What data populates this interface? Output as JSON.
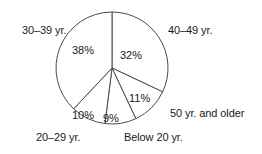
{
  "chart_data": {
    "type": "pie",
    "title": "",
    "subtitle": "",
    "xlabel": "",
    "ylabel": "",
    "legend_position": "none",
    "grid": false,
    "start_angle_deg": 0,
    "direction": "clockwise",
    "categories": [
      "40–49 yr.",
      "50 yr. and older",
      "Below 20 yr.",
      "20–29 yr.",
      "30–39 yr."
    ],
    "values": [
      32,
      11,
      9,
      10,
      38
    ],
    "value_labels": [
      "32%",
      "11%",
      "9%",
      "10%",
      "38%"
    ],
    "slices": [
      {
        "label": "40–49 yr.",
        "value": 32,
        "value_label": "32%"
      },
      {
        "label": "50 yr. and older",
        "value": 11,
        "value_label": "11%"
      },
      {
        "label": "Below 20 yr.",
        "value": 9,
        "value_label": "9%"
      },
      {
        "label": "20–29 yr.",
        "value": 10,
        "value_label": "10%"
      },
      {
        "label": "30–39 yr.",
        "value": 38,
        "value_label": "38%"
      }
    ]
  },
  "colors": {
    "background": "#ffffff",
    "outline": "#4a4a4a",
    "text": "#1a1a1a"
  },
  "geometry": {
    "center_x": 112,
    "center_y": 68,
    "radius": 56
  }
}
